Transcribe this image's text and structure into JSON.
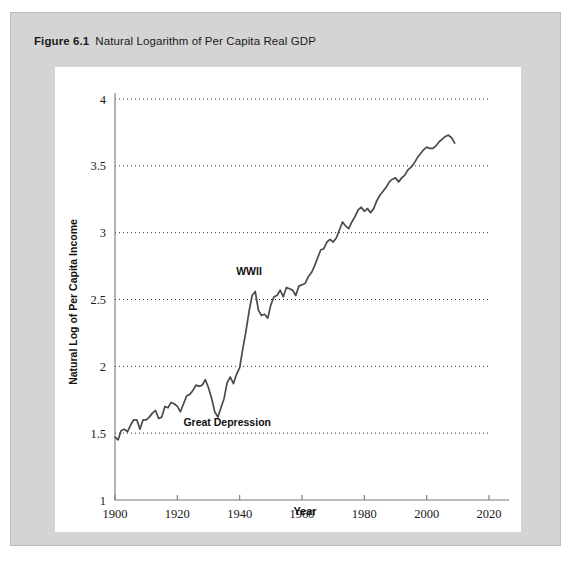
{
  "figure": {
    "number": "Figure 6.1",
    "caption": "Natural Logarithm of Per Capita Real GDP"
  },
  "colors": {
    "frame": "#d4d4d4",
    "card": "#ffffff",
    "line": "#4a4a4a",
    "grid": "#333333",
    "axis": "#777777",
    "text": "#1a1a1a"
  },
  "chart_data": {
    "type": "line",
    "title": "Natural Logarithm of Per Capita Real GDP",
    "xlabel": "Year",
    "ylabel": "Natural Log of Per Capita Income",
    "xlim": [
      1900,
      2020
    ],
    "ylim": [
      1,
      4
    ],
    "xticks": [
      1900,
      1920,
      1940,
      1960,
      1980,
      2000,
      2020
    ],
    "xticklabels": [
      "1900",
      "1920",
      "1940",
      "1960",
      "1980",
      "2000",
      "2020"
    ],
    "yticks": [
      1,
      1.5,
      2,
      2.5,
      3,
      3.5,
      4
    ],
    "yticklabels": [
      "1",
      "1.5",
      "2",
      "2.5",
      "3",
      "3.5",
      "4"
    ],
    "grid": "horizontal-dotted",
    "legend": "none",
    "annotations": [
      {
        "text": "WWII",
        "x": 1943,
        "y": 2.68
      },
      {
        "text": "Great Depression",
        "x": 1936,
        "y": 1.55
      }
    ],
    "series": [
      {
        "name": "Natural log of per capita real GDP",
        "x": [
          1900,
          1901,
          1902,
          1903,
          1904,
          1905,
          1906,
          1907,
          1908,
          1909,
          1910,
          1911,
          1912,
          1913,
          1914,
          1915,
          1916,
          1917,
          1918,
          1919,
          1920,
          1921,
          1922,
          1923,
          1924,
          1925,
          1926,
          1927,
          1928,
          1929,
          1930,
          1931,
          1932,
          1933,
          1934,
          1935,
          1936,
          1937,
          1938,
          1939,
          1940,
          1941,
          1942,
          1943,
          1944,
          1945,
          1946,
          1947,
          1948,
          1949,
          1950,
          1951,
          1952,
          1953,
          1954,
          1955,
          1956,
          1957,
          1958,
          1959,
          1960,
          1961,
          1962,
          1963,
          1964,
          1965,
          1966,
          1967,
          1968,
          1969,
          1970,
          1971,
          1972,
          1973,
          1974,
          1975,
          1976,
          1977,
          1978,
          1979,
          1980,
          1981,
          1982,
          1983,
          1984,
          1985,
          1986,
          1987,
          1988,
          1989,
          1990,
          1991,
          1992,
          1993,
          1994,
          1995,
          1996,
          1997,
          1998,
          1999,
          2000,
          2001,
          2002,
          2003,
          2004,
          2005,
          2006,
          2007,
          2008,
          2009
        ],
        "values": [
          1.47,
          1.45,
          1.52,
          1.53,
          1.51,
          1.56,
          1.6,
          1.6,
          1.53,
          1.6,
          1.6,
          1.62,
          1.65,
          1.67,
          1.61,
          1.62,
          1.7,
          1.69,
          1.73,
          1.72,
          1.7,
          1.66,
          1.72,
          1.78,
          1.79,
          1.82,
          1.86,
          1.85,
          1.86,
          1.9,
          1.84,
          1.76,
          1.66,
          1.62,
          1.69,
          1.76,
          1.88,
          1.92,
          1.87,
          1.94,
          1.99,
          2.13,
          2.26,
          2.41,
          2.53,
          2.56,
          2.42,
          2.38,
          2.39,
          2.36,
          2.46,
          2.52,
          2.53,
          2.57,
          2.52,
          2.59,
          2.58,
          2.57,
          2.53,
          2.6,
          2.61,
          2.62,
          2.67,
          2.7,
          2.75,
          2.81,
          2.87,
          2.88,
          2.93,
          2.95,
          2.93,
          2.96,
          3.02,
          3.08,
          3.05,
          3.03,
          3.08,
          3.12,
          3.17,
          3.19,
          3.16,
          3.18,
          3.15,
          3.18,
          3.24,
          3.28,
          3.31,
          3.34,
          3.38,
          3.4,
          3.41,
          3.38,
          3.41,
          3.43,
          3.47,
          3.49,
          3.52,
          3.56,
          3.59,
          3.62,
          3.64,
          3.63,
          3.63,
          3.65,
          3.68,
          3.7,
          3.72,
          3.73,
          3.71,
          3.67
        ]
      }
    ]
  }
}
